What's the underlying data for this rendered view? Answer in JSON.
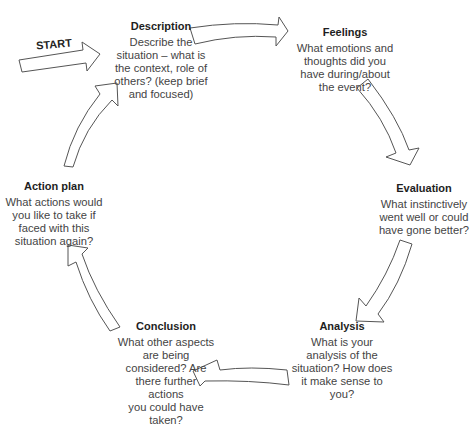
{
  "diagram": {
    "start_label": "START",
    "stroke_color": "#555555",
    "fill_color": "#ffffff",
    "stages": [
      {
        "id": "description",
        "title": "Description",
        "text": "Describe the\nsituation – what is\nthe context, role of\nothers? (keep brief\nand focused)"
      },
      {
        "id": "feelings",
        "title": "Feelings",
        "text": "What emotions and\nthoughts did you\nhave during/about\nthe event?"
      },
      {
        "id": "evaluation",
        "title": "Evaluation",
        "text": "What instinctively\nwent well or could\nhave gone better?"
      },
      {
        "id": "analysis",
        "title": "Analysis",
        "text": "What is your\nanalysis of the\nsituation? How does\nit make sense to\nyou?"
      },
      {
        "id": "conclusion",
        "title": "Conclusion",
        "text": "What other aspects\nare being\nconsidered? Are\nthere further\nactions\nyou could have\ntaken?"
      },
      {
        "id": "action_plan",
        "title": "Action plan",
        "text": "What actions would\nyou like to take if\nfaced with this\nsituation again?"
      }
    ],
    "arrows": [
      {
        "from": "start",
        "to": "description"
      },
      {
        "from": "description",
        "to": "feelings"
      },
      {
        "from": "feelings",
        "to": "evaluation"
      },
      {
        "from": "evaluation",
        "to": "analysis"
      },
      {
        "from": "analysis",
        "to": "conclusion"
      },
      {
        "from": "conclusion",
        "to": "action_plan"
      },
      {
        "from": "action_plan",
        "to": "description"
      }
    ]
  }
}
